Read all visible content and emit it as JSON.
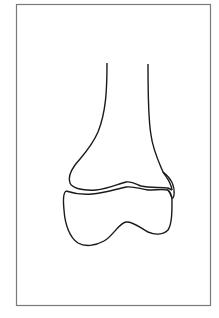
{
  "figure": {
    "subject": "distal femur line drawing",
    "parts": [
      "shaft",
      "growth plate",
      "epiphysis",
      "condyles"
    ],
    "colors": {
      "background": "#ffffff",
      "frame": "#7a7a7a",
      "outline": "#1a1a1a"
    }
  }
}
